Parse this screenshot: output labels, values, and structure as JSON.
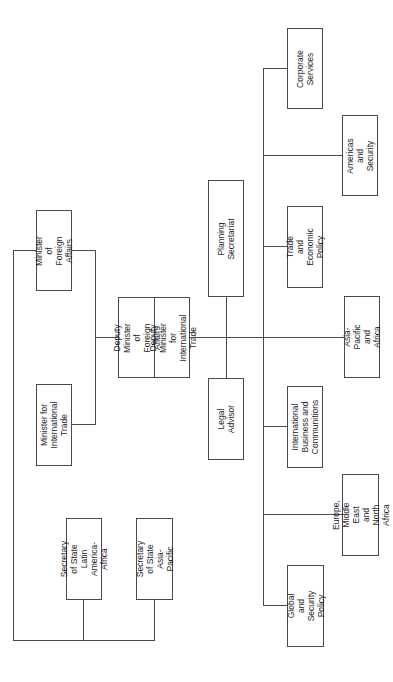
{
  "chart": {
    "orientation": "rotated-90-ccw",
    "line_color": "#4a4a4a",
    "text_color": "#1e1e1e",
    "nodes": {
      "minister_foreign_affairs": "Minister of\nForeign Affairs",
      "minister_international_trade": "Minister for\nInternational\nTrade",
      "deputy_minister_foreign_affairs": "Deputy Minister of\nForeign Affairs",
      "deputy_minister_international_trade": "Deputy Minister\nfor International\nTrade",
      "planning_secretariat": "Planning\nSecretariat",
      "legal_advisor": "Legal\nAdvisor",
      "secretary_state_latin_america_africa": "Secretary of State\nLatin America-\nAfrica",
      "secretary_state_asia_pacific": "Secretary of State\nAsia-Pacific",
      "corporate_services": "Corporate\nServices",
      "americas_and_security": "Americas and\nSecurity",
      "trade_and_economic_policy": "Trade and\nEconomic Policy",
      "asia_pacific_and_africa": "Asia-Pacific and\nAfrica",
      "international_business_communitions": "International\nBusiness and\nCommunitions",
      "europe_middle_east_north_africa": "Europe, Middle\nEast and North\nAfrica",
      "global_and_security_policy": "Global and\nSecurity Policy"
    }
  }
}
